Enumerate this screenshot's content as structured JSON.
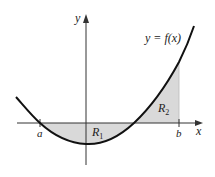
{
  "diagram": {
    "curve_label": "y = f(x)",
    "axes": {
      "x_label": "x",
      "y_label": "y"
    },
    "points": {
      "a": "a",
      "b": "b"
    },
    "regions": [
      {
        "name": "R",
        "subscript": "1",
        "description": "below x-axis between a and second root"
      },
      {
        "name": "R",
        "subscript": "2",
        "description": "above x-axis between second root and b"
      }
    ],
    "colors": {
      "curve": "#111111",
      "axis": "#333333",
      "shade": "#d9d9d9",
      "text": "#222222"
    }
  }
}
